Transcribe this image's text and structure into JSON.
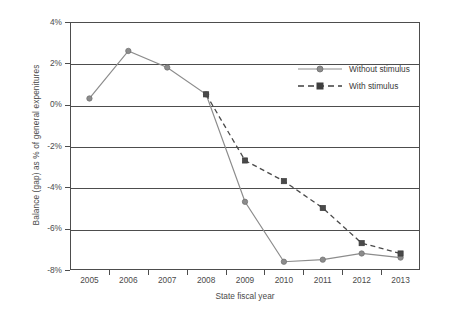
{
  "chart_data": {
    "type": "line",
    "title": "",
    "xlabel": "State fiscal year",
    "ylabel": "Balance (gap) as % of general expenitures",
    "categories": [
      "2005",
      "2006",
      "2007",
      "2008",
      "2009",
      "2010",
      "2011",
      "2012",
      "2013"
    ],
    "ylim": [
      -8,
      4
    ],
    "ytick_labels": [
      "4%",
      "2%",
      "0%",
      "-2%",
      "-4%",
      "-6%",
      "-8%"
    ],
    "ytick_values": [
      4,
      2,
      0,
      -2,
      -4,
      -6,
      -8
    ],
    "grid": true,
    "legend_position": "upper right",
    "series": [
      {
        "name": "Without stimulus",
        "x": [
          "2005",
          "2006",
          "2007",
          "2008",
          "2009",
          "2010",
          "2011",
          "2012",
          "2013"
        ],
        "values": [
          0.3,
          2.6,
          1.8,
          0.5,
          -4.7,
          -7.6,
          -7.5,
          -7.2,
          -7.4
        ],
        "line_style": "solid",
        "marker": "circle",
        "color": "#8c8c8c"
      },
      {
        "name": "With stimulus",
        "x": [
          "2008",
          "2009",
          "2010",
          "2011",
          "2012",
          "2013"
        ],
        "values": [
          0.5,
          -2.7,
          -3.7,
          -5.0,
          -6.7,
          -7.2
        ],
        "line_style": "dashed",
        "marker": "square",
        "color": "#4a4a4a"
      }
    ]
  },
  "legend": {
    "items": [
      {
        "label": "Without stimulus"
      },
      {
        "label": "With stimulus"
      }
    ]
  },
  "axes": {
    "y_title": "Balance (gap) as % of general expenitures",
    "x_title": "State fiscal year"
  },
  "colors": {
    "axis": "#4d4d4d",
    "without_stimulus": "#8c8c8c",
    "with_stimulus": "#4a4a4a",
    "background": "#ffffff"
  }
}
